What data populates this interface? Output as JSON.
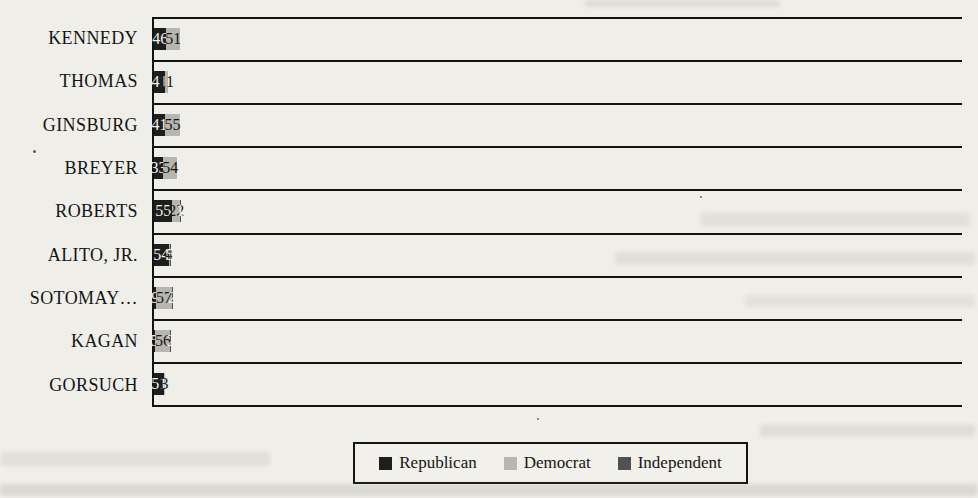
{
  "page": {
    "background_color": "#efeee9"
  },
  "chart_data": {
    "type": "bar",
    "orientation": "horizontal",
    "stacked": true,
    "title": "",
    "xlabel": "",
    "ylabel": "",
    "xlim": [
      0,
      119
    ],
    "grid": "horizontal category separator lines framing each bar row",
    "legend_position": "bottom",
    "data_labels": true,
    "categories": [
      "KENNEDY",
      "THOMAS",
      "GINSBURG",
      "BREYER",
      "ROBERTS",
      "ALITO, JR.",
      "SOTOMAY…",
      "KAGAN",
      "GORSUCH"
    ],
    "series": [
      {
        "name": "Republican",
        "color": "#1f1e1e",
        "label_color": "#f3f2ee",
        "values": [
          46,
          41,
          41,
          33,
          55,
          54,
          9,
          5,
          51
        ]
      },
      {
        "name": "Democrat",
        "color": "#b7b5b0",
        "label_color": "#161616",
        "values": [
          51,
          11,
          55,
          54,
          22,
          4,
          57,
          56,
          3
        ]
      },
      {
        "name": "Independent",
        "color": "#515153",
        "label_color": "#f3f2ee",
        "values": [
          0,
          0,
          0,
          0,
          1,
          5,
          2,
          2,
          0
        ]
      }
    ]
  }
}
